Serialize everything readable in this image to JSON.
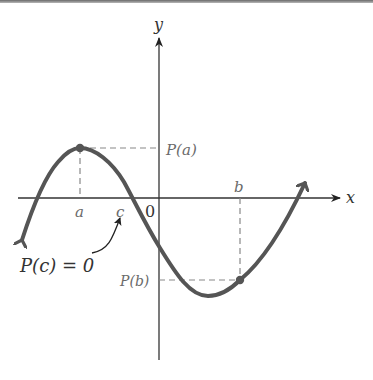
{
  "figure": {
    "axes": {
      "x_label": "x",
      "y_label": "y",
      "origin_label": "0"
    },
    "points": {
      "a": {
        "label": "a",
        "value_label": "P(a)"
      },
      "b": {
        "label": "b",
        "value_label": "P(b)"
      },
      "c": {
        "label": "c"
      }
    },
    "annotation": {
      "text_left": "P(c) = 0"
    },
    "colors": {
      "curve": "#555555",
      "axes": "#333333",
      "dashed": "#888888",
      "text": "#333333"
    }
  }
}
